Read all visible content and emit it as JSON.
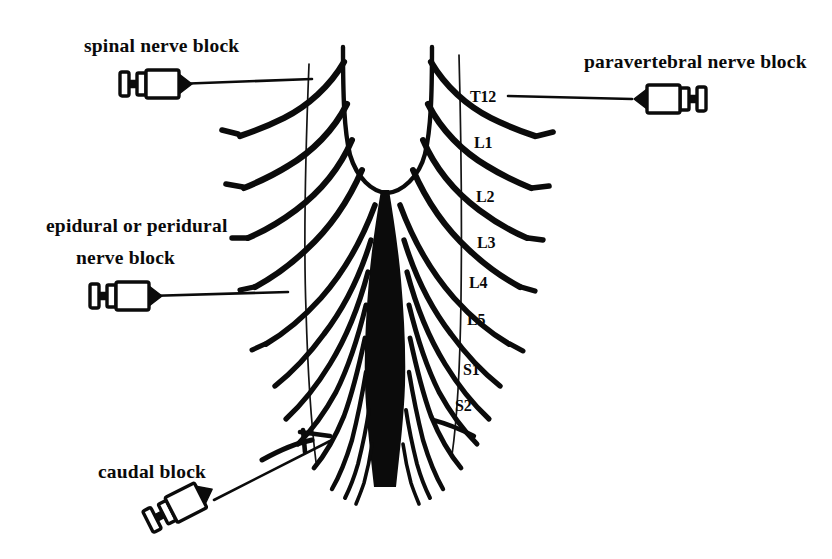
{
  "figure": {
    "background_color": "#ffffff",
    "ink_color": "#0b0b0b"
  },
  "labels": {
    "spinal": "spinal nerve block",
    "paravertebral": "paravertebral nerve block",
    "epidural_line1": "epidural or peridural",
    "epidural_line2": "nerve block",
    "caudal": "caudal block"
  },
  "vertebral_levels": [
    {
      "label": "T12",
      "x": 470,
      "y": 102
    },
    {
      "label": "L1",
      "x": 474,
      "y": 148
    },
    {
      "label": "L2",
      "x": 476,
      "y": 202
    },
    {
      "label": "L3",
      "x": 477,
      "y": 248
    },
    {
      "label": "L4",
      "x": 469,
      "y": 288
    },
    {
      "label": "L5",
      "x": 467,
      "y": 325
    },
    {
      "label": "S1",
      "x": 463,
      "y": 375
    },
    {
      "label": "S2",
      "x": 455,
      "y": 411
    }
  ],
  "syringes": [
    {
      "name": "spinal-syringe",
      "x": 120,
      "y": 84,
      "angle": 0,
      "direction": "right"
    },
    {
      "name": "paravertebral-syringe",
      "x": 634,
      "y": 99,
      "angle": 0,
      "direction": "left"
    },
    {
      "name": "epidural-syringe",
      "x": 90,
      "y": 296,
      "angle": 0,
      "direction": "right"
    },
    {
      "name": "caudal-syringe",
      "x": 155,
      "y": 520,
      "angle": -31,
      "direction": "right"
    }
  ],
  "needles": [
    {
      "name": "spinal-needle",
      "from_x": 176,
      "from_y": 84,
      "to_x": 312,
      "to_y": 79
    },
    {
      "name": "paravertebral-needle",
      "from_x": 632,
      "from_y": 99,
      "to_x": 508,
      "to_y": 96
    },
    {
      "name": "epidural-needle",
      "from_x": 148,
      "from_y": 296,
      "to_x": 288,
      "to_y": 292
    },
    {
      "name": "caudal-needle",
      "from_x": 214,
      "from_y": 500,
      "to_x": 330,
      "to_y": 441
    }
  ],
  "anatomy": {
    "cord_left_x": 343,
    "cord_right_x": 432,
    "cord_top_y": 47,
    "conus_tip_y": 193,
    "filum_bottom_y": 487,
    "dura_left_x": 303,
    "dura_right_x": 461
  }
}
